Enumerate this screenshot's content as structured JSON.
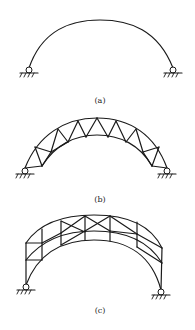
{
  "figure": {
    "panels": [
      {
        "id": "a",
        "caption": "(a)",
        "description": "Solid-web two-hinged arch",
        "support_left": "pinned",
        "support_right": "pinned"
      },
      {
        "id": "b",
        "caption": "(b)",
        "description": "Trussed two-hinged arch with crescent-shaped lattice",
        "support_left": "pinned",
        "support_right": "pinned"
      },
      {
        "id": "c",
        "caption": "(c)",
        "description": "Two-hinged arch with multi-layer braced lattice and vertical end posts",
        "support_left": "pinned",
        "support_right": "pinned"
      }
    ],
    "line_color": "#1a1a1a",
    "background": "#ffffff"
  }
}
